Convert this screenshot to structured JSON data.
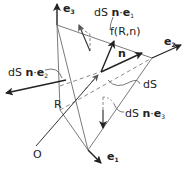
{
  "diagram": {
    "colors": {
      "line": "#222222",
      "light_line": "#8a8a8a",
      "dashed": "#8a8a8a",
      "background": "#ffffff"
    },
    "axes": [
      {
        "name": "e3",
        "base": "e",
        "sub": "3"
      },
      {
        "name": "e2",
        "base": "e",
        "sub": "2"
      },
      {
        "name": "e1",
        "base": "e",
        "sub": "1"
      }
    ],
    "labels": {
      "origin": "O",
      "position_vector": "R",
      "traction": "f(R,n)",
      "normal": "n",
      "area": "dS",
      "face_e1": {
        "prefix": "dS ",
        "n": "n",
        "dot": "·",
        "e": "e",
        "sub": "1"
      },
      "face_e2": {
        "prefix": "dS ",
        "n": "n",
        "dot": "·",
        "e": "e",
        "sub": "2"
      },
      "face_e3": {
        "prefix": "dS ",
        "n": "n",
        "dot": "·",
        "e": "e",
        "sub": "3"
      }
    }
  }
}
